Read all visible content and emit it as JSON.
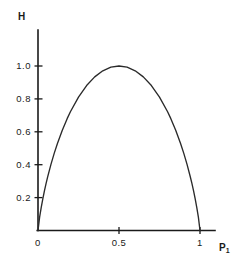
{
  "figure": {
    "background_color": "#ffffff",
    "line_color": "#1a1a1a",
    "curve_color": "#2a2a2a",
    "y_axis_title": "H",
    "x_axis_title_base": "P",
    "x_axis_title_sub": "1"
  },
  "chart_data": {
    "type": "line",
    "title": "",
    "xlabel": "P1",
    "ylabel": "H",
    "xlim": [
      0,
      1.09
    ],
    "ylim": [
      0,
      1.08
    ],
    "grid": false,
    "legend": null,
    "x_ticks": [
      {
        "value": 0,
        "label": "0"
      },
      {
        "value": 0.5,
        "label": "0.5"
      },
      {
        "value": 1,
        "label": "1"
      }
    ],
    "y_ticks": [
      {
        "value": 0.2,
        "label": "0.2"
      },
      {
        "value": 0.4,
        "label": "0.4"
      },
      {
        "value": 0.6,
        "label": "0.6"
      },
      {
        "value": 0.8,
        "label": "0.8"
      },
      {
        "value": 1.0,
        "label": "1.0"
      }
    ],
    "series": [
      {
        "name": "binary entropy",
        "x": [
          0.0,
          0.01,
          0.02,
          0.03,
          0.04,
          0.05,
          0.06,
          0.08,
          0.1,
          0.12,
          0.15,
          0.18,
          0.2,
          0.25,
          0.3,
          0.35,
          0.4,
          0.45,
          0.5,
          0.55,
          0.6,
          0.65,
          0.7,
          0.75,
          0.8,
          0.82,
          0.85,
          0.88,
          0.9,
          0.92,
          0.94,
          0.95,
          0.96,
          0.97,
          0.98,
          0.99,
          1.0
        ],
        "y": [
          0.0,
          0.081,
          0.141,
          0.194,
          0.242,
          0.286,
          0.327,
          0.402,
          0.469,
          0.529,
          0.61,
          0.68,
          0.722,
          0.811,
          0.881,
          0.934,
          0.971,
          0.993,
          1.0,
          0.993,
          0.971,
          0.934,
          0.881,
          0.811,
          0.722,
          0.68,
          0.61,
          0.529,
          0.469,
          0.402,
          0.327,
          0.286,
          0.242,
          0.194,
          0.141,
          0.081,
          0.0
        ]
      }
    ]
  }
}
